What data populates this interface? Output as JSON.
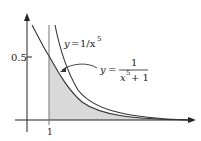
{
  "figure": {
    "type": "function-graph",
    "y_tick_label": "0.5",
    "x_tick_label": "1",
    "curve1_label": {
      "lhs": "y",
      "eq": "=",
      "rhs": "1/x",
      "exp": "5"
    },
    "curve2_label": {
      "lhs": "y",
      "eq": "=",
      "num": "1",
      "den_base": "x",
      "den_exp": "5",
      "den_rest": "+ 1"
    },
    "shaded_region": "area under y = 1/(x^5+1) for x ≥ 1",
    "colors": {
      "curve": "#333333",
      "axis": "#222222",
      "shade": "#d9d9d9"
    }
  }
}
